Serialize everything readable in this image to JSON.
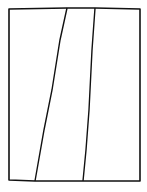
{
  "drawing": {
    "description": "Hand-drawn rectangle divided by two slanted lines",
    "stroke_color": "#111111",
    "background_color": "#ffffff",
    "frame": {
      "left": 9,
      "top": 8,
      "right": 140,
      "bottom": 181
    },
    "dividers": [
      {
        "x_top": 67,
        "x_bottom": 35
      },
      {
        "x_top": 95,
        "x_bottom": 83
      }
    ]
  }
}
